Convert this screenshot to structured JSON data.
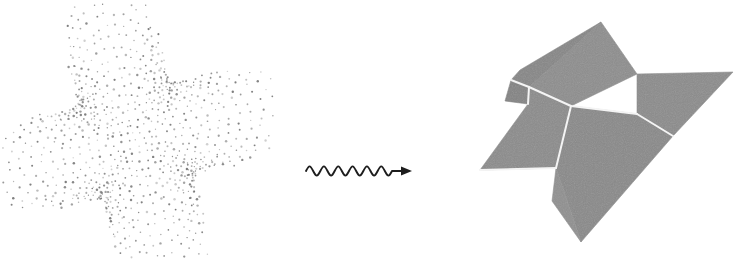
{
  "figure": {
    "type": "surface-reconstruction-diagram",
    "background_color": "#ffffff",
    "width": 754,
    "height": 261,
    "caption": "",
    "panels": [
      {
        "id": "point-cloud",
        "role": "input",
        "label": ""
      },
      {
        "id": "arrow",
        "role": "transform",
        "label": ""
      },
      {
        "id": "mesh",
        "role": "output",
        "label": ""
      }
    ]
  },
  "point_cloud": {
    "name": "sampled-point-cloud",
    "description": "dotted star-shaped wavy surface sample",
    "dot_color": "#6e6e6e",
    "dot_radius": 0.9,
    "point_count": 980,
    "grid_u": 34,
    "grid_v": 34,
    "center_x": 136,
    "center_y": 140,
    "radius_x": 118,
    "radius_y": 118,
    "lobes": 4,
    "lobe_amplitude": 0.42,
    "rotation_deg": -14,
    "jitter": 2.1,
    "seed": 20240517,
    "extent": {
      "left": 18,
      "top": 28,
      "right": 252,
      "bottom": 253
    }
  },
  "arrow": {
    "name": "squiggly-arrow",
    "label": "",
    "color": "#1d1d1d",
    "stroke_width": 1.9,
    "start_x": 306,
    "end_x": 412,
    "baseline_y": 171,
    "wave_cycles": 6,
    "wave_amplitude": 6.2,
    "wave_span": 86,
    "head_length": 11,
    "head_width": 9
  },
  "mesh": {
    "name": "reconstructed-polygon-mesh",
    "description": "faceted gray polygonal surface with white crease edges",
    "fill_color": "#8a8a8a",
    "fill_color_dark": "#7d7d7d",
    "fill_color_light": "#949494",
    "edge_color": "#f4f4f4",
    "edge_width": 2.0,
    "outline_color": "#6f6f6f",
    "dither": true,
    "facets": [
      {
        "name": "top-large-facet",
        "shade": "#8d8d8d",
        "points": "601,22 637,74 571,106 529,87"
      },
      {
        "name": "upper-left-facet",
        "shade": "#868686",
        "points": "601,22 529,87 511,80 520,70"
      },
      {
        "name": "left-notch-facet",
        "shade": "#838383",
        "points": "529,87 511,80 505,101 528,104"
      },
      {
        "name": "left-wing-facet",
        "shade": "#8b8b8b",
        "points": "529,87 528,104 480,170 556,168 571,106"
      },
      {
        "name": "right-wing-facet",
        "shade": "#8b8b8b",
        "points": "637,74 733,72 673,136 637,114"
      },
      {
        "name": "center-lower-facet",
        "shade": "#898989",
        "points": "571,106 637,114 673,136 581,242 556,168"
      },
      {
        "name": "bottom-tail-facet",
        "shade": "#8f8f8f",
        "points": "556,168 581,242 552,201"
      }
    ],
    "crease_edges": [
      {
        "name": "crease-top-horizontal",
        "points": "529,87 571,106 637,114"
      },
      {
        "name": "crease-diagonal-right",
        "points": "571,106 556,168"
      },
      {
        "name": "crease-left-notch",
        "points": "511,80 529,87 528,104"
      },
      {
        "name": "crease-lower-left",
        "points": "556,168 480,170"
      },
      {
        "name": "crease-wing-split",
        "points": "637,114 673,136"
      }
    ],
    "extent": {
      "left": 480,
      "top": 22,
      "right": 733,
      "bottom": 242
    }
  }
}
